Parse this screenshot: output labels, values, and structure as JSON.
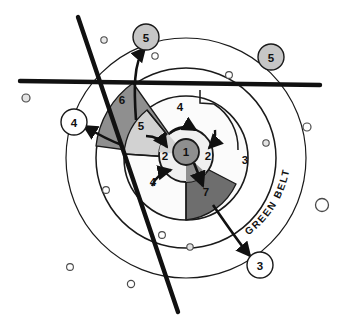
{
  "diagram": {
    "background_color": "#ffffff",
    "line_color": "#1a1a1a",
    "thick_line_color": "#111111"
  },
  "palette": {
    "white": "#ffffff",
    "pale_gray": "#f2f2f2",
    "light_gray": "#d9d9d9",
    "mid_gray": "#c9c9c9",
    "dark_gray": "#8f8f8f",
    "darker_gray": "#6e6e6e",
    "callout_gray": "#c6c6c6",
    "dot_fill": "#e8e8e8",
    "outline": "#1a1a1a"
  },
  "zones": [
    {
      "id": "zone-1",
      "label": "1",
      "x": 186,
      "y": 152,
      "desc": "central core"
    },
    {
      "id": "zone-2-left",
      "label": "2",
      "x": 165,
      "y": 155,
      "desc": "inner ring left"
    },
    {
      "id": "zone-2-right",
      "label": "2",
      "x": 208,
      "y": 155,
      "desc": "inner ring right"
    },
    {
      "id": "zone-3",
      "label": "3",
      "x": 245,
      "y": 160,
      "desc": "outer ring right"
    },
    {
      "id": "zone-4-top",
      "label": "4",
      "x": 180,
      "y": 108,
      "desc": "middle ring top"
    },
    {
      "id": "zone-4-bottom",
      "label": "4",
      "x": 153,
      "y": 182,
      "desc": "middle ring lower left"
    },
    {
      "id": "zone-5",
      "label": "5",
      "x": 141,
      "y": 125,
      "desc": "light gray wedge"
    },
    {
      "id": "zone-6",
      "label": "6",
      "x": 122,
      "y": 100,
      "desc": "dark gray wedge upper left"
    },
    {
      "id": "zone-7",
      "label": "7",
      "x": 206,
      "y": 191,
      "desc": "dark gray wedge lower right"
    }
  ],
  "callouts": [
    {
      "id": "callout-5-top",
      "label": "5",
      "x": 146,
      "y": 37,
      "r": 13,
      "fill": "#c6c6c6"
    },
    {
      "id": "callout-5-right",
      "label": "5",
      "x": 271,
      "y": 57,
      "r": 13,
      "fill": "#c6c6c6"
    },
    {
      "id": "callout-4-left",
      "label": "4",
      "x": 74,
      "y": 122,
      "r": 13,
      "fill": "#ffffff"
    },
    {
      "id": "callout-3-bottom",
      "label": "3",
      "x": 260,
      "y": 265,
      "r": 13,
      "fill": "#ffffff"
    }
  ],
  "annotations": {
    "green_belt": "GREEN BELT"
  },
  "rings": [
    {
      "id": "ring-outer-greenbelt",
      "cx": 186,
      "cy": 158,
      "r": 120,
      "fill": "#ffffff"
    },
    {
      "id": "ring-3",
      "cx": 186,
      "cy": 158,
      "r": 90,
      "fill": "#ffffff"
    },
    {
      "id": "ring-4",
      "cx": 186,
      "cy": 158,
      "r": 62,
      "fill": "#f7f7f7"
    },
    {
      "id": "ring-2",
      "cx": 186,
      "cy": 155,
      "r": 27,
      "fill": "#efefef"
    },
    {
      "id": "core-1",
      "cx": 186,
      "cy": 152,
      "r": 13,
      "fill": "#8f8f8f"
    }
  ],
  "transport_lines": [
    {
      "id": "horizontal-route",
      "desc": "thick horizontal route"
    },
    {
      "id": "diagonal-route",
      "desc": "thick diagonal route"
    }
  ],
  "scatter_dots": [
    {
      "x": 104,
      "y": 40,
      "r": 3.2
    },
    {
      "x": 155,
      "y": 56,
      "r": 3.2
    },
    {
      "x": 229,
      "y": 75,
      "r": 3.4
    },
    {
      "x": 26,
      "y": 98,
      "r": 4.0
    },
    {
      "x": 307,
      "y": 127,
      "r": 4.0
    },
    {
      "x": 266,
      "y": 143,
      "r": 3.2
    },
    {
      "x": 322,
      "y": 205,
      "r": 6.5
    },
    {
      "x": 106,
      "y": 190,
      "r": 3.4
    },
    {
      "x": 162,
      "y": 235,
      "r": 3.4
    },
    {
      "x": 190,
      "y": 247,
      "r": 3.2
    },
    {
      "x": 70,
      "y": 267,
      "r": 3.4
    },
    {
      "x": 131,
      "y": 284,
      "r": 3.6
    }
  ]
}
